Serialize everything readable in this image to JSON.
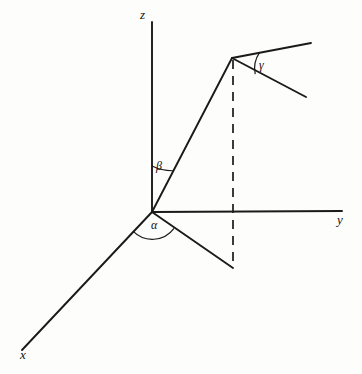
{
  "figure": {
    "type": "3d-coordinate-axes-diagram",
    "background_color": "#fdfdfc",
    "line_color": "#1a1a1a",
    "width": 362,
    "height": 374,
    "axis_labels": {
      "z": "z",
      "y": "y",
      "x": "x"
    },
    "angle_labels": {
      "alpha": "α",
      "beta": "β",
      "gamma": "γ"
    },
    "geometry": {
      "origin": {
        "x": 152,
        "y": 212
      },
      "z_axis_tip": {
        "x": 152,
        "y": 22
      },
      "y_axis_tip": {
        "x": 342,
        "y": 211
      },
      "x_axis_tip": {
        "x": 22,
        "y": 350
      },
      "vector_tip": {
        "x": 232,
        "y": 58
      },
      "projection_point": {
        "x": 233,
        "y": 268
      },
      "dashed_top": {
        "x": 233,
        "y": 60
      },
      "dashed_bottom": {
        "x": 233,
        "y": 268
      },
      "upper_ray_tip": {
        "x": 311,
        "y": 43
      },
      "lower_ray_tip": {
        "x": 306,
        "y": 97
      },
      "alpha_arc_radius": 27,
      "beta_arc_radius": 46,
      "gamma_arc_radius": 28
    }
  }
}
